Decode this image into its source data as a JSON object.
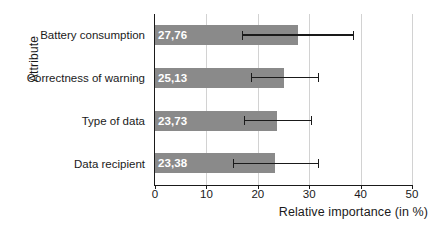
{
  "chart_data": {
    "type": "bar",
    "orientation": "horizontal",
    "title": "",
    "xlabel": "Relative importance (in %)",
    "ylabel": "Attribute",
    "xlim": [
      0,
      50
    ],
    "xticks": [
      0,
      10,
      20,
      30,
      40,
      50
    ],
    "xtick_labels": [
      "0",
      "10",
      "20",
      "30",
      "40",
      "50"
    ],
    "grid": "vertical",
    "legend": "none",
    "bar_color": "#8a8a8a",
    "error_bar_color": "#1a1a1a",
    "decimal_separator": ",",
    "categories": [
      "Battery consumption",
      "Correctness of warning",
      "Type of data",
      "Data recipient"
    ],
    "values": [
      27.76,
      25.13,
      23.73,
      23.38
    ],
    "value_labels": [
      "27,76",
      "25,13",
      "23,73",
      "23,38"
    ],
    "error_low": [
      16.9,
      18.6,
      17.3,
      15.2
    ],
    "error_high": [
      38.5,
      31.7,
      30.3,
      31.7
    ],
    "bars": [
      {
        "category": "Battery consumption",
        "value": 27.76,
        "label": "27,76",
        "low": 16.9,
        "high": 38.5
      },
      {
        "category": "Correctness of warning",
        "value": 25.13,
        "label": "25,13",
        "low": 18.6,
        "high": 31.7
      },
      {
        "category": "Type of data",
        "value": 23.73,
        "label": "23,73",
        "low": 17.3,
        "high": 30.3
      },
      {
        "category": "Data recipient",
        "value": 23.38,
        "label": "23,38",
        "low": 15.2,
        "high": 31.7
      }
    ]
  }
}
